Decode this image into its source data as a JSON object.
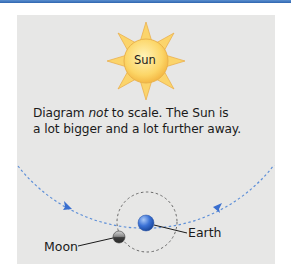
{
  "diagram": {
    "sun": {
      "label": "Sun",
      "fill": "#fbd56a",
      "ray_fill": "#fbd46b",
      "stroke": "#e6a93a"
    },
    "caption": {
      "line1_pre": "Diagram ",
      "line1_em": "not",
      "line1_post": " to scale. The Sun is",
      "line2": "a lot bigger and a lot further away."
    },
    "earth": {
      "label": "Earth",
      "fill": "#3b72d6"
    },
    "moon": {
      "label": "Moon",
      "fill": "#5a5a5a"
    },
    "colors": {
      "panel_bg": "#e7e7e6",
      "earth_orbit": "#5d8fd8",
      "moon_orbit": "#6a6a6a",
      "top_bar": "#3a72bd"
    }
  }
}
